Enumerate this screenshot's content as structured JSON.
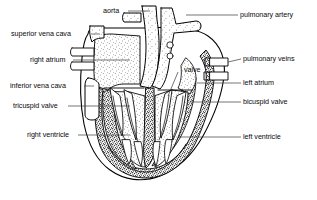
{
  "figure": {
    "type": "anatomical-line-diagram",
    "background_color": "#ffffff",
    "ink_color": "#000000"
  },
  "labels": {
    "aorta": "aorta",
    "pulmonary_artery": "pulmonary artery",
    "superior_vena_cava": "superior vena cava",
    "right_atrium": "right atrium",
    "pulmonary_veins": "pulmonary veins",
    "valve": "valve",
    "left_atrium": "left atrium",
    "inferior_vena_cava": "inferior vena cava",
    "tricuspid_valve": "tricuspid valve",
    "bicuspid_valve": "bicuspid valve",
    "right_ventricle": "right ventricle",
    "left_ventricle": "left ventricle"
  },
  "label_list": [
    {
      "key": "aorta",
      "text": "aorta",
      "side": "top",
      "x": 103,
      "y": 8
    },
    {
      "key": "pulmonary_artery",
      "text": "pulmonary artery",
      "side": "right",
      "x": 240,
      "y": 11
    },
    {
      "key": "superior_vena_cava",
      "text": "superior vena cava",
      "side": "left",
      "x": 11,
      "y": 31
    },
    {
      "key": "right_atrium",
      "text": "right atrium",
      "side": "left",
      "x": 30,
      "y": 57
    },
    {
      "key": "pulmonary_veins",
      "text": "pulmonary veins",
      "side": "right",
      "x": 243,
      "y": 55
    },
    {
      "key": "valve",
      "text": "valve",
      "side": "right",
      "x": 184,
      "y": 66
    },
    {
      "key": "left_atrium",
      "text": "left atrium",
      "side": "right",
      "x": 243,
      "y": 78
    },
    {
      "key": "inferior_vena_cava",
      "text": "inferior vena cava",
      "side": "left",
      "x": 10,
      "y": 83
    },
    {
      "key": "tricuspid_valve",
      "text": "tricuspid valve",
      "side": "left",
      "x": 13,
      "y": 103
    },
    {
      "key": "bicuspid_valve",
      "text": "bicuspid valve",
      "side": "right",
      "x": 243,
      "y": 98
    },
    {
      "key": "right_ventricle",
      "text": "right ventricle",
      "side": "left",
      "x": 27,
      "y": 131
    },
    {
      "key": "left_ventricle",
      "text": "left ventricle",
      "side": "right",
      "x": 243,
      "y": 133
    }
  ],
  "structures": [
    "aorta",
    "pulmonary artery",
    "superior vena cava",
    "inferior vena cava",
    "right atrium",
    "left atrium",
    "right ventricle",
    "left ventricle",
    "tricuspid valve",
    "bicuspid valve",
    "pulmonary veins",
    "valve"
  ]
}
